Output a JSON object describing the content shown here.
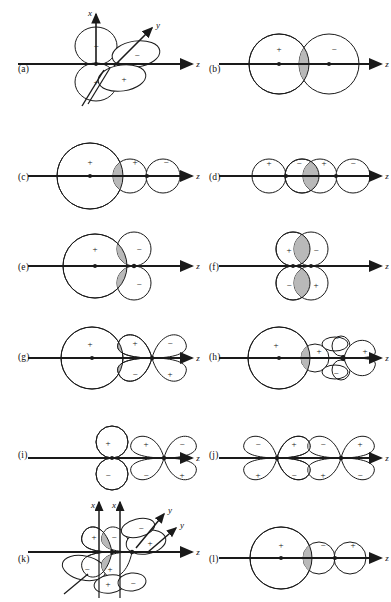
{
  "figure": {
    "axis_labels": {
      "z": "z",
      "x": "x",
      "y": "y"
    },
    "colors": {
      "stroke": "#1a1a1a",
      "overlap_fill": "#b9b9b9",
      "lobe_fill": "#ffffff",
      "background": "#ffffff"
    }
  },
  "panels": [
    {
      "id": "a",
      "label": "(a)",
      "row": 1,
      "column": "left",
      "orbital_left": "p",
      "orbital_right": "p",
      "geometry": "perspective",
      "axes_shown": [
        "x",
        "y",
        "z"
      ],
      "signs": [
        "-",
        "+",
        "-",
        "+"
      ],
      "shaded_overlap": false
    },
    {
      "id": "b",
      "label": "(b)",
      "row": 1,
      "column": "right",
      "orbital_left": "s",
      "orbital_right": "s",
      "geometry": "inline",
      "axes_shown": [
        "z"
      ],
      "signs": [
        "+",
        "-"
      ],
      "shaded_overlap": true
    },
    {
      "id": "c",
      "label": "(c)",
      "row": 2,
      "column": "left",
      "orbital_left": "s",
      "orbital_right": "p",
      "geometry": "inline",
      "axes_shown": [
        "z"
      ],
      "signs": [
        "+",
        "+",
        "-"
      ],
      "shaded_overlap": true
    },
    {
      "id": "d",
      "label": "(d)",
      "row": 2,
      "column": "right",
      "orbital_left": "p",
      "orbital_right": "p",
      "geometry": "inline",
      "axes_shown": [
        "z"
      ],
      "signs": [
        "+",
        "-",
        "+",
        "-"
      ],
      "shaded_overlap": true
    },
    {
      "id": "e",
      "label": "(e)",
      "row": 3,
      "column": "left",
      "orbital_left": "s",
      "orbital_right": "p-perpendicular",
      "geometry": "inline",
      "axes_shown": [
        "z"
      ],
      "signs": [
        "+",
        "-",
        "-"
      ],
      "shaded_overlap": true
    },
    {
      "id": "f",
      "label": "(f)",
      "row": 3,
      "column": "right",
      "orbital_left": "p-perpendicular",
      "orbital_right": "p-perpendicular",
      "geometry": "inline",
      "axes_shown": [
        "z"
      ],
      "signs": [
        "+",
        "-",
        "-",
        "+"
      ],
      "shaded_overlap": true
    },
    {
      "id": "g",
      "label": "(g)",
      "row": 4,
      "column": "left",
      "orbital_left": "s",
      "orbital_right": "d",
      "geometry": "inline",
      "axes_shown": [
        "z"
      ],
      "signs": [
        "+",
        "+",
        "-",
        "-",
        "+"
      ],
      "shaded_overlap": true
    },
    {
      "id": "h",
      "label": "(h)",
      "row": 4,
      "column": "right",
      "orbital_left": "s",
      "orbital_right": "dz2",
      "geometry": "inline",
      "axes_shown": [
        "z"
      ],
      "signs": [
        "+",
        "+",
        "-",
        "-",
        "+"
      ],
      "shaded_overlap": true
    },
    {
      "id": "i",
      "label": "(i)",
      "row": 5,
      "column": "left",
      "orbital_left": "p-perpendicular",
      "orbital_right": "d",
      "geometry": "inline",
      "axes_shown": [
        "z"
      ],
      "signs": [
        "+",
        "-",
        "+",
        "-",
        "-",
        "+"
      ],
      "shaded_overlap": true
    },
    {
      "id": "j",
      "label": "(j)",
      "row": 5,
      "column": "right",
      "orbital_left": "d",
      "orbital_right": "d",
      "geometry": "inline",
      "axes_shown": [
        "z"
      ],
      "signs": [
        "-",
        "+",
        "+",
        "-",
        "-",
        "+",
        "+",
        "-"
      ],
      "shaded_overlap": true
    },
    {
      "id": "k",
      "label": "(k)",
      "row": 6,
      "column": "left",
      "orbital_left": "d",
      "orbital_right": "d",
      "geometry": "perspective",
      "axes_shown": [
        "x",
        "x",
        "y",
        "y",
        "z"
      ],
      "signs": [
        "+",
        "-",
        "-",
        "+",
        "-",
        "+",
        "+",
        "-"
      ],
      "shaded_overlap": true
    },
    {
      "id": "l",
      "label": "(l)",
      "row": 6,
      "column": "right",
      "orbital_left": "s",
      "orbital_right": "p",
      "geometry": "inline",
      "axes_shown": [
        "z"
      ],
      "signs": [
        "+",
        "-",
        "+"
      ],
      "shaded_overlap": true
    }
  ]
}
